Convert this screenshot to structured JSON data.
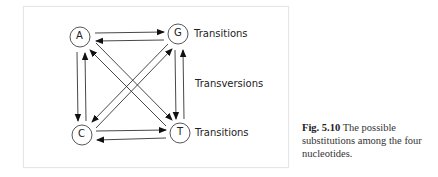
{
  "diagram": {
    "nodes": [
      {
        "id": "A",
        "label": "A",
        "x": 80,
        "y": 37
      },
      {
        "id": "G",
        "label": "G",
        "x": 178,
        "y": 34
      },
      {
        "id": "C",
        "label": "C",
        "x": 82,
        "y": 135
      },
      {
        "id": "T",
        "label": "T",
        "x": 180,
        "y": 133
      }
    ],
    "labels": {
      "top_right": "Transitions",
      "middle_right": "Transversions",
      "bottom_right": "Transitions"
    },
    "edges": [
      {
        "from": "A",
        "to": "G",
        "type": "transition"
      },
      {
        "from": "G",
        "to": "A",
        "type": "transition"
      },
      {
        "from": "C",
        "to": "T",
        "type": "transition"
      },
      {
        "from": "T",
        "to": "C",
        "type": "transition"
      },
      {
        "from": "A",
        "to": "C",
        "type": "transversion"
      },
      {
        "from": "C",
        "to": "A",
        "type": "transversion"
      },
      {
        "from": "G",
        "to": "T",
        "type": "transversion"
      },
      {
        "from": "T",
        "to": "G",
        "type": "transversion"
      },
      {
        "from": "A",
        "to": "T",
        "type": "transversion"
      },
      {
        "from": "T",
        "to": "A",
        "type": "transversion"
      },
      {
        "from": "G",
        "to": "C",
        "type": "transversion"
      },
      {
        "from": "C",
        "to": "G",
        "type": "transversion"
      }
    ]
  },
  "caption": {
    "fig_label": "Fig. 5.10",
    "text": "The possible substitutions among the four nucleotides."
  }
}
